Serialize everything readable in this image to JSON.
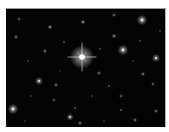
{
  "image": {
    "subject": "star field",
    "background": "#030303",
    "frame": {
      "x": 6,
      "y": 8,
      "width": 160,
      "height": 119
    },
    "bright_star": {
      "x": 82,
      "y": 56,
      "radius": 4,
      "spike_length": 14,
      "color": "#ffffff"
    },
    "stars": [
      {
        "x": 142,
        "y": 19,
        "r": 2.4,
        "o": 0.85
      },
      {
        "x": 123,
        "y": 49,
        "r": 2.4,
        "o": 0.85
      },
      {
        "x": 156,
        "y": 57,
        "r": 1.8,
        "o": 0.8
      },
      {
        "x": 13,
        "y": 108,
        "r": 2.4,
        "o": 0.85
      },
      {
        "x": 39,
        "y": 80,
        "r": 1.8,
        "o": 0.8
      },
      {
        "x": 70,
        "y": 116,
        "r": 1.6,
        "o": 0.75
      },
      {
        "x": 50,
        "y": 26,
        "r": 1.1,
        "o": 0.6
      },
      {
        "x": 83,
        "y": 21,
        "r": 1.1,
        "o": 0.6
      },
      {
        "x": 114,
        "y": 35,
        "r": 1.1,
        "o": 0.55
      },
      {
        "x": 114,
        "y": 14,
        "r": 1.0,
        "o": 0.5
      },
      {
        "x": 19,
        "y": 18,
        "r": 0.9,
        "o": 0.45
      },
      {
        "x": 16,
        "y": 36,
        "r": 1.0,
        "o": 0.5
      },
      {
        "x": 45,
        "y": 50,
        "r": 1.0,
        "o": 0.55
      },
      {
        "x": 64,
        "y": 41,
        "r": 0.8,
        "o": 0.4
      },
      {
        "x": 56,
        "y": 84,
        "r": 1.0,
        "o": 0.55
      },
      {
        "x": 54,
        "y": 99,
        "r": 0.9,
        "o": 0.45
      },
      {
        "x": 80,
        "y": 122,
        "r": 1.0,
        "o": 0.55
      },
      {
        "x": 75,
        "y": 107,
        "r": 0.8,
        "o": 0.4
      },
      {
        "x": 99,
        "y": 72,
        "r": 1.0,
        "o": 0.5
      },
      {
        "x": 143,
        "y": 73,
        "r": 1.0,
        "o": 0.55
      },
      {
        "x": 153,
        "y": 83,
        "r": 0.9,
        "o": 0.45
      },
      {
        "x": 121,
        "y": 95,
        "r": 0.9,
        "o": 0.45
      },
      {
        "x": 135,
        "y": 119,
        "r": 1.0,
        "o": 0.55
      },
      {
        "x": 156,
        "y": 110,
        "r": 1.0,
        "o": 0.5
      },
      {
        "x": 121,
        "y": 109,
        "r": 0.8,
        "o": 0.45
      },
      {
        "x": 109,
        "y": 85,
        "r": 0.8,
        "o": 0.4
      },
      {
        "x": 28,
        "y": 60,
        "r": 0.7,
        "o": 0.35
      },
      {
        "x": 31,
        "y": 95,
        "r": 0.7,
        "o": 0.35
      },
      {
        "x": 92,
        "y": 95,
        "r": 0.7,
        "o": 0.35
      },
      {
        "x": 140,
        "y": 40,
        "r": 0.7,
        "o": 0.35
      },
      {
        "x": 100,
        "y": 48,
        "r": 0.7,
        "o": 0.35
      },
      {
        "x": 160,
        "y": 30,
        "r": 0.7,
        "o": 0.35
      },
      {
        "x": 25,
        "y": 120,
        "r": 0.7,
        "o": 0.3
      },
      {
        "x": 104,
        "y": 120,
        "r": 0.7,
        "o": 0.3
      },
      {
        "x": 60,
        "y": 70,
        "r": 0.6,
        "o": 0.3
      },
      {
        "x": 133,
        "y": 60,
        "r": 0.6,
        "o": 0.3
      }
    ]
  }
}
